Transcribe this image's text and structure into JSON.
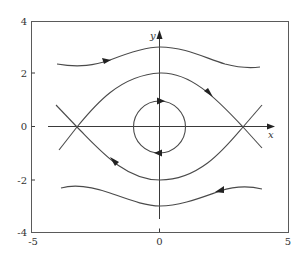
{
  "figure": {
    "type": "phase-portrait",
    "x_axis": {
      "label": "x",
      "ticks": [
        "-5",
        "0",
        "5"
      ],
      "range": [
        -5,
        5
      ]
    },
    "y_axis": {
      "label": "y",
      "ticks": [
        "4",
        "2",
        "0",
        "-2",
        "-4"
      ],
      "range": [
        -4,
        4
      ]
    },
    "equilibria": [
      {
        "type": "center",
        "x": 0,
        "y": 0
      },
      {
        "type": "saddle",
        "x": -3.2,
        "y": 0
      },
      {
        "type": "saddle",
        "x": 3.2,
        "y": 0
      }
    ],
    "trajectories": [
      {
        "name": "upper-outer",
        "direction": "right",
        "y_at_x0": 3
      },
      {
        "name": "upper-separatrix",
        "direction": "right",
        "y_at_x0": 2
      },
      {
        "name": "closed-orbit",
        "direction": "clockwise",
        "radius": 1
      },
      {
        "name": "lower-separatrix",
        "direction": "left",
        "y_at_x0": -2
      },
      {
        "name": "lower-outer",
        "direction": "left",
        "y_at_x0": -3
      }
    ],
    "colors": {
      "curve": "#4a4a4a",
      "axis": "#3a3a3a",
      "frame": "#5a5a5a",
      "background": "#ffffff"
    }
  }
}
